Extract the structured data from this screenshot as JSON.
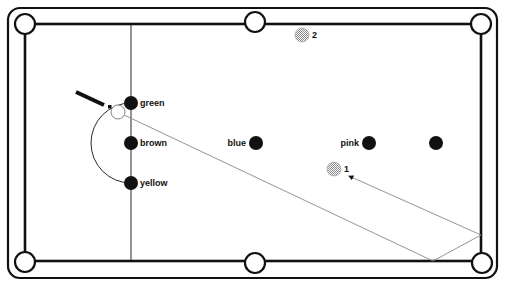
{
  "diagram": {
    "colors": {
      "line": "#111111",
      "path": "#888888",
      "hatch": "#aaaaaa",
      "background": "#ffffff"
    },
    "table": {
      "outer": {
        "x": 8,
        "y": 8,
        "w": 489,
        "h": 270,
        "r": 12
      },
      "cushion": {
        "left": 25,
        "top": 24,
        "right": 481,
        "bottom": 261
      },
      "baulk_line_x": 131,
      "pockets": [
        {
          "name": "top-left",
          "cx": 25,
          "cy": 24
        },
        {
          "name": "top-middle",
          "cx": 255,
          "cy": 22
        },
        {
          "name": "top-right",
          "cx": 481,
          "cy": 24
        },
        {
          "name": "bottom-left",
          "cx": 25,
          "cy": 262
        },
        {
          "name": "bottom-middle",
          "cx": 255,
          "cy": 263
        },
        {
          "name": "bottom-right",
          "cx": 482,
          "cy": 263
        }
      ]
    },
    "balls": [
      {
        "id": "green",
        "label": "green",
        "cx": 131,
        "cy": 103,
        "lx": 140,
        "ly": 106,
        "anchor": "start"
      },
      {
        "id": "brown",
        "label": "brown",
        "cx": 131,
        "cy": 143,
        "lx": 140,
        "ly": 146,
        "anchor": "start"
      },
      {
        "id": "yellow",
        "label": "yellow",
        "cx": 131,
        "cy": 183,
        "lx": 140,
        "ly": 186,
        "anchor": "start"
      },
      {
        "id": "blue",
        "label": "blue",
        "cx": 256,
        "cy": 143,
        "lx": 246,
        "ly": 146,
        "anchor": "end"
      },
      {
        "id": "pink",
        "label": "pink",
        "cx": 369,
        "cy": 143,
        "lx": 359,
        "ly": 146,
        "anchor": "end"
      },
      {
        "id": "black",
        "label": "",
        "cx": 436,
        "cy": 143,
        "lx": 0,
        "ly": 0,
        "anchor": "start"
      }
    ],
    "red_balls": [
      {
        "id": "ball-1",
        "label": "1",
        "cx": 334,
        "cy": 169,
        "lx": 344,
        "ly": 172
      },
      {
        "id": "ball-2",
        "label": "2",
        "cx": 302,
        "cy": 35,
        "lx": 312,
        "ly": 38
      }
    ],
    "cue_ball": {
      "cx": 118,
      "cy": 112
    },
    "cue": {
      "x1": 76,
      "y1": 92,
      "x2": 104,
      "y2": 105,
      "tip_x": 110,
      "tip_y": 107
    },
    "d_arc": {
      "cx": 131,
      "cy": 143,
      "r": 40
    },
    "shot_path": [
      [
        122,
        114
      ],
      [
        433,
        261
      ],
      [
        481,
        235
      ],
      [
        349,
        176
      ]
    ]
  }
}
